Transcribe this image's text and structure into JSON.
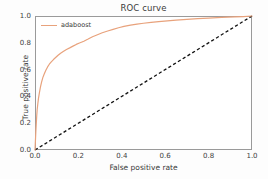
{
  "chart_data": {
    "type": "line",
    "title": "ROC curve",
    "xlabel": "False positive rate",
    "ylabel": "True positive rate",
    "xlim": [
      0.0,
      1.0
    ],
    "ylim": [
      0.0,
      1.0
    ],
    "xticks": [
      "0.0",
      "0.2",
      "0.4",
      "0.6",
      "0.8",
      "1.0"
    ],
    "xtick_values": [
      0.0,
      0.2,
      0.4,
      0.6,
      0.8,
      1.0
    ],
    "yticks": [
      "0.0",
      "0.2",
      "0.4",
      "0.6",
      "0.8",
      "1.0"
    ],
    "ytick_values": [
      0.0,
      0.2,
      0.4,
      0.6,
      0.8,
      1.0
    ],
    "grid": false,
    "legend_position": "upper left",
    "series": [
      {
        "name": "adaboost",
        "color": "#e8a27c",
        "style": "solid",
        "x": [
          0.0,
          0.002,
          0.004,
          0.006,
          0.008,
          0.01,
          0.013,
          0.016,
          0.02,
          0.025,
          0.03,
          0.036,
          0.042,
          0.05,
          0.058,
          0.066,
          0.075,
          0.085,
          0.095,
          0.105,
          0.118,
          0.13,
          0.145,
          0.16,
          0.175,
          0.19,
          0.205,
          0.225,
          0.245,
          0.265,
          0.285,
          0.31,
          0.335,
          0.36,
          0.385,
          0.41,
          0.44,
          0.47,
          0.5,
          0.535,
          0.57,
          0.61,
          0.65,
          0.7,
          0.75,
          0.8,
          0.86,
          0.92,
          0.96,
          1.0
        ],
        "y": [
          0.0,
          0.07,
          0.14,
          0.2,
          0.255,
          0.3,
          0.345,
          0.385,
          0.425,
          0.47,
          0.505,
          0.54,
          0.565,
          0.595,
          0.62,
          0.64,
          0.658,
          0.675,
          0.69,
          0.705,
          0.722,
          0.735,
          0.75,
          0.762,
          0.775,
          0.788,
          0.798,
          0.812,
          0.828,
          0.845,
          0.858,
          0.875,
          0.888,
          0.9,
          0.912,
          0.922,
          0.932,
          0.94,
          0.946,
          0.952,
          0.958,
          0.964,
          0.969,
          0.975,
          0.98,
          0.984,
          0.989,
          0.993,
          0.996,
          1.0
        ]
      },
      {
        "name": "chance",
        "color": "#111111",
        "style": "dashed",
        "x": [
          0.0,
          1.0
        ],
        "y": [
          0.0,
          1.0
        ]
      }
    ],
    "legend_entries": [
      "adaboost"
    ]
  },
  "legend": {
    "label": "adaboost"
  }
}
